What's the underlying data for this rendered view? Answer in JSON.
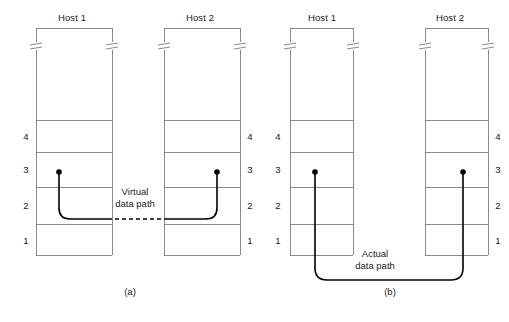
{
  "figure": {
    "panels": [
      {
        "id": "a",
        "caption": "(a)",
        "path_label_line1": "Virtual",
        "path_label_line2": "data path",
        "path_style": "dashed-horizontal-at-layer-2",
        "hosts": [
          {
            "title": "Host 1",
            "layers": [
              "4",
              "3",
              "2",
              "1"
            ],
            "numbers_side": "left",
            "endpoint_layer": "3"
          },
          {
            "title": "Host 2",
            "layers": [
              "4",
              "3",
              "2",
              "1"
            ],
            "numbers_side": "right",
            "endpoint_layer": "3"
          }
        ]
      },
      {
        "id": "b",
        "caption": "(b)",
        "path_label_line1": "Actual",
        "path_label_line2": "data path",
        "path_style": "solid-below-stacks",
        "hosts": [
          {
            "title": "Host 1",
            "layers": [
              "4",
              "3",
              "2",
              "1"
            ],
            "numbers_side": "left",
            "endpoint_layer": "3"
          },
          {
            "title": "Host 2",
            "layers": [
              "4",
              "3",
              "2",
              "1"
            ],
            "numbers_side": "right",
            "endpoint_layer": "3"
          }
        ]
      }
    ],
    "colors": {
      "stack_line": "#8a8a8a",
      "data_path": "#000000",
      "background": "#ffffff",
      "text": "#1a1a1a"
    }
  }
}
